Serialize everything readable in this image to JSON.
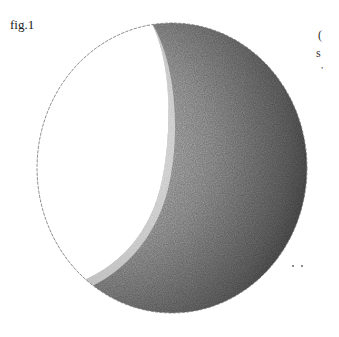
{
  "figure": {
    "caption": "fig.1",
    "margin_text": [
      "(",
      "s",
      ","
    ],
    "colors": {
      "lit": "#ffffff",
      "shadow_mid": "#9a9a9a",
      "shadow_dark": "#4a4a4a",
      "outline": "#777777"
    }
  }
}
